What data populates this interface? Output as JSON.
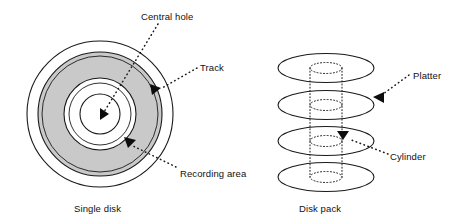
{
  "figure": {
    "background_color": "#ffffff",
    "stroke_color": "#1a1a1a",
    "recording_area_fill": "#c9c9c9"
  },
  "single_disk": {
    "caption": "Single disk",
    "labels": {
      "central_hole": "Central hole",
      "track": "Track",
      "recording_area": "Recording area"
    },
    "geometry": {
      "center_x": 100,
      "center_y": 114,
      "outer_radius": 73,
      "recording_outer_radius": 62,
      "track_ring_radius": 58,
      "recording_inner_radius": 36,
      "hub_ring_radius": 31,
      "central_hole_radius": 20
    }
  },
  "disk_pack": {
    "caption": "Disk pack",
    "labels": {
      "platter": "Platter",
      "cylinder": "Cylinder"
    },
    "geometry": {
      "center_x": 326,
      "platter_rx": 48,
      "platter_ry": 14.5,
      "cylinder_rx": 16,
      "cylinder_ry": 5.5,
      "platter_centers_y": [
        68,
        105,
        141,
        177
      ]
    }
  }
}
